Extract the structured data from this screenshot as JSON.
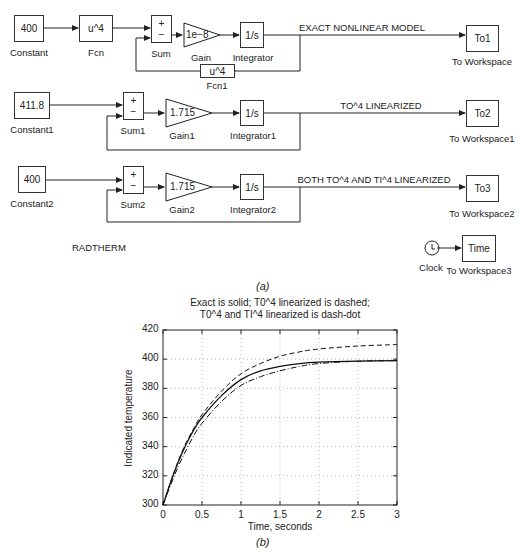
{
  "diagram": {
    "rows": [
      {
        "constant": {
          "value": "400",
          "label": "Constant"
        },
        "fcn": {
          "value": "u^4",
          "label": "Fcn"
        },
        "sum": {
          "plus": "+",
          "minus": "−",
          "label": "Sum"
        },
        "gain": {
          "value": "1e−8",
          "label": "Gain"
        },
        "integrator": {
          "value": "1/s",
          "label": "Integrator"
        },
        "feedback_fcn": {
          "value": "u^4",
          "label": "Fcn1"
        },
        "signal_label": "EXACT NONLINEAR MODEL",
        "workspace": {
          "value": "To1",
          "label": "To Workspace"
        }
      },
      {
        "constant": {
          "value": "411.8",
          "label": "Constant1"
        },
        "sum": {
          "plus": "+",
          "minus": "−",
          "label": "Sum1"
        },
        "gain": {
          "value": "1.715",
          "label": "Gain1"
        },
        "integrator": {
          "value": "1/s",
          "label": "Integrator1"
        },
        "signal_label": "TO^4 LINEARIZED",
        "workspace": {
          "value": "To2",
          "label": "To Workspace1"
        }
      },
      {
        "constant": {
          "value": "400",
          "label": "Constant2"
        },
        "sum": {
          "plus": "+",
          "minus": "−",
          "label": "Sum2"
        },
        "gain": {
          "value": "1.715",
          "label": "Gain2"
        },
        "integrator": {
          "value": "1/s",
          "label": "Integrator2"
        },
        "signal_label": "BOTH TO^4 AND TI^4 LINEARIZED",
        "workspace": {
          "value": "To3",
          "label": "To Workspace2"
        }
      }
    ],
    "model_name": "RADTHERM",
    "clock": {
      "label": "Clock",
      "icon": "clock-icon"
    },
    "time_workspace": {
      "value": "Time",
      "label": "To Workspace3"
    },
    "caption": "(a)"
  },
  "chart_caption": "(b)",
  "chart_data": {
    "type": "line",
    "title": "Exact is solid; T0^4 linearized is dashed;\nT0^4 and TI^4 linearized is dash-dot",
    "title_lines": [
      "Exact is solid; T0^4 linearized is dashed;",
      "T0^4 and TI^4 linearized is dash-dot"
    ],
    "xlabel": "Time, seconds",
    "ylabel": "Indicated temperature",
    "xlim": [
      0,
      3
    ],
    "ylim": [
      300,
      420
    ],
    "xticks": [
      "0",
      "0.5",
      "1",
      "1.5",
      "2",
      "2.5",
      "3"
    ],
    "yticks": [
      "300",
      "320",
      "340",
      "360",
      "380",
      "400",
      "420"
    ],
    "grid": true,
    "legend": "none (described in title)",
    "x": [
      0,
      0.1,
      0.2,
      0.3,
      0.4,
      0.5,
      0.75,
      1.0,
      1.25,
      1.5,
      1.75,
      2.0,
      2.5,
      3.0
    ],
    "series": [
      {
        "name": "Exact (solid)",
        "style": "solid",
        "values": [
          300,
          316,
          330,
          342,
          352,
          360,
          375,
          386,
          392,
          395,
          397,
          398,
          398.7,
          399
        ]
      },
      {
        "name": "T0^4 linearized (dashed)",
        "style": "dashed",
        "values": [
          300,
          316,
          331,
          343,
          353,
          362,
          378,
          390,
          397,
          402,
          405,
          407,
          409,
          410
        ]
      },
      {
        "name": "T0^4 and TI^4 linearized (dash-dot)",
        "style": "dashdot",
        "values": [
          300,
          314,
          327,
          338,
          348,
          356,
          371,
          382,
          388,
          392,
          395,
          397,
          398.6,
          399
        ]
      }
    ]
  }
}
